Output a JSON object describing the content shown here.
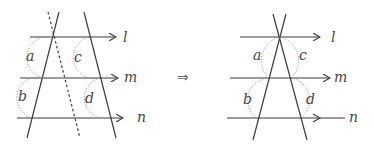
{
  "diagram": {
    "implies_symbol": "⇒",
    "left_figure": {
      "parallel_lines": [
        {
          "label": "l",
          "y": 37
        },
        {
          "label": "m",
          "y": 78
        },
        {
          "label": "n",
          "y": 118
        }
      ],
      "angle_labels": [
        "a",
        "b",
        "c",
        "d"
      ],
      "auxiliary_line": "dashed"
    },
    "right_figure": {
      "parallel_lines": [
        {
          "label": "l",
          "y": 37
        },
        {
          "label": "m",
          "y": 78
        },
        {
          "label": "n",
          "y": 118
        }
      ],
      "angle_labels": [
        "a",
        "b",
        "c",
        "d"
      ]
    }
  }
}
